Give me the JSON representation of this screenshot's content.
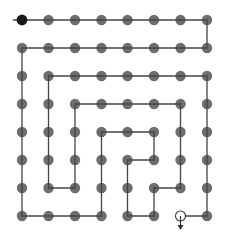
{
  "diagram": {
    "type": "spiral-path-grid",
    "grid": {
      "cols": 8,
      "rows": 8,
      "col_x": [
        22,
        48.5,
        75,
        101.5,
        127.5,
        154,
        180.5,
        207
      ],
      "row_y": [
        20,
        48,
        76,
        104,
        132,
        160,
        188,
        216
      ]
    },
    "colors": {
      "dot": "#6e6e6e",
      "start_dot": "#1a1a1a",
      "line": "#444444",
      "end_marker": "#333333",
      "background": "#ffffff"
    },
    "start": {
      "col": 0,
      "row": 0,
      "lead_in_x": 13
    },
    "end": {
      "col": 6,
      "row": 7,
      "marker": "hollow-circle-with-down-arrow"
    },
    "path": [
      [
        0,
        0
      ],
      [
        7,
        0
      ],
      [
        7,
        1
      ],
      [
        0,
        1
      ],
      [
        0,
        7
      ],
      [
        3,
        7
      ],
      [
        3,
        4
      ],
      [
        5,
        4
      ],
      [
        5,
        5
      ],
      [
        4,
        5
      ],
      [
        4,
        7
      ],
      [
        5,
        7
      ],
      [
        5,
        6
      ],
      [
        6,
        6
      ],
      [
        6,
        3
      ],
      [
        2,
        3
      ],
      [
        2,
        6
      ],
      [
        1,
        6
      ],
      [
        1,
        2
      ],
      [
        7,
        2
      ],
      [
        7,
        7
      ],
      [
        6,
        7
      ]
    ]
  }
}
